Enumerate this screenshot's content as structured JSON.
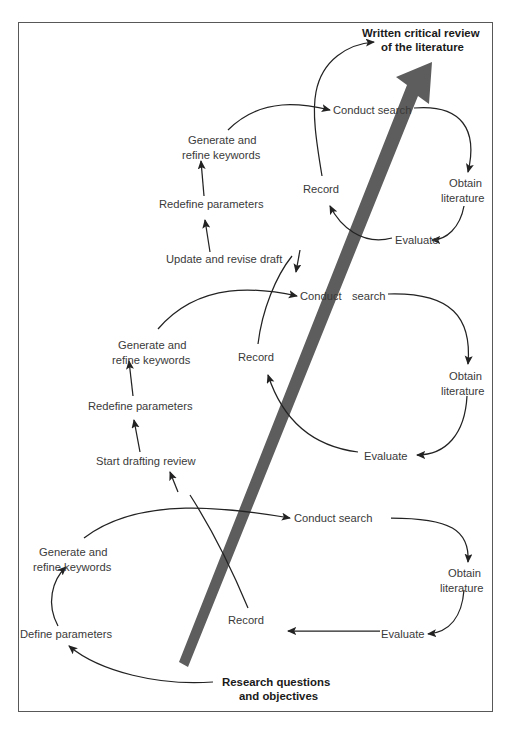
{
  "figure": {
    "frame_color": "#585858",
    "label_color": "#3a3a3a",
    "emphasis_color": "#1a1a1a",
    "arrow_color": "#5d5d5d",
    "background": "#ffffff"
  },
  "endpoints": {
    "start": "Research questions\nand objectives",
    "start_line1": "Research questions",
    "start_line2": "and objectives",
    "end": "Written critical review\nof the literature",
    "end_line1": "Written critical review",
    "end_line2": "of the literature"
  },
  "cycles": [
    {
      "name": "cycle-1-bottom",
      "nodes": [
        {
          "id": "define-parameters",
          "label": "Define parameters",
          "x": 67,
          "y": 634
        },
        {
          "id": "generate-refine-keywords-1",
          "label_line1": "Generate and",
          "label_line2": "refine keywords",
          "x": 68,
          "y": 552
        },
        {
          "id": "conduct-search-1",
          "label": "Conduct search",
          "x": 325,
          "y": 518
        },
        {
          "id": "obtain-literature-1",
          "label_line1": "Obtain",
          "label_line2": "literature",
          "x": 465,
          "y": 573
        },
        {
          "id": "evaluate-1",
          "label": "Evaluate",
          "x": 401,
          "y": 634
        },
        {
          "id": "record-1",
          "label": "Record",
          "x": 248,
          "y": 620
        }
      ]
    },
    {
      "name": "cycle-2-middle",
      "nodes": [
        {
          "id": "start-drafting-review",
          "label": "Start drafting review",
          "x": 148,
          "y": 461
        },
        {
          "id": "redefine-parameters-2",
          "label": "Redefine parameters",
          "x": 145,
          "y": 406
        },
        {
          "id": "generate-refine-keywords-2",
          "label_line1": "Generate and",
          "label_line2": "refine keywords",
          "x": 152,
          "y": 345
        },
        {
          "id": "conduct-search-2",
          "label": "Conduct search",
          "x": 332,
          "y": 296
        },
        {
          "id": "obtain-literature-2",
          "label_line1": "Obtain",
          "label_line2": "literature",
          "x": 466,
          "y": 376
        },
        {
          "id": "evaluate-2",
          "label": "Evaluate",
          "x": 384,
          "y": 456
        },
        {
          "id": "record-2",
          "label": "Record",
          "x": 258,
          "y": 357
        }
      ]
    },
    {
      "name": "cycle-3-top",
      "nodes": [
        {
          "id": "update-revise-draft",
          "label": "Update and revise draft",
          "x": 222,
          "y": 259
        },
        {
          "id": "redefine-parameters-3",
          "label": "Redefine parameters",
          "x": 216,
          "y": 204
        },
        {
          "id": "generate-refine-keywords-3",
          "label_line1": "Generate and",
          "label_line2": "refine keywords",
          "x": 222,
          "y": 140
        },
        {
          "id": "conduct-search-3",
          "label": "Conduct search",
          "x": 364,
          "y": 110
        },
        {
          "id": "obtain-literature-3",
          "label_line1": "Obtain",
          "label_line2": "literature",
          "x": 466,
          "y": 183
        },
        {
          "id": "evaluate-3",
          "label": "Evaluate",
          "x": 413,
          "y": 240
        },
        {
          "id": "record-3",
          "label": "Record",
          "x": 322,
          "y": 189
        }
      ]
    }
  ],
  "labels": {
    "define_parameters": "Define parameters",
    "generate_and": "Generate and",
    "refine_keywords": "refine keywords",
    "conduct_search": "Conduct search",
    "conduct": "Conduct",
    "search": "search",
    "obtain": "Obtain",
    "literature": "literature",
    "evaluate": "Evaluate",
    "record": "Record",
    "start_drafting_review": "Start drafting review",
    "redefine_parameters": "Redefine parameters",
    "update_and_revise_draft": "Update and revise draft"
  }
}
